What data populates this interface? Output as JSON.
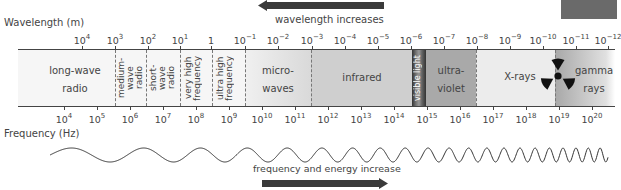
{
  "header": {
    "wavelength_label": "Wavelength (m)",
    "wavelength_arrow_text": "wavelength increases",
    "corner_badge": ""
  },
  "footer": {
    "frequency_label": "Frequency (Hz)",
    "frequency_arrow_text": "frequency and energy increase"
  },
  "wavelength_ticks": [
    {
      "base": "10",
      "exp": "4",
      "x": 82
    },
    {
      "base": "10",
      "exp": "3",
      "x": 115
    },
    {
      "base": "10",
      "exp": "2",
      "x": 148
    },
    {
      "base": "10",
      "exp": "1",
      "x": 180
    },
    {
      "base": "1",
      "exp": "",
      "x": 211
    },
    {
      "base": "10",
      "exp": "−1",
      "x": 245
    },
    {
      "base": "10",
      "exp": "−2",
      "x": 278
    },
    {
      "base": "10",
      "exp": "−3",
      "x": 312
    },
    {
      "base": "10",
      "exp": "−4",
      "x": 345
    },
    {
      "base": "10",
      "exp": "−5",
      "x": 378
    },
    {
      "base": "10",
      "exp": "−6",
      "x": 411
    },
    {
      "base": "10",
      "exp": "−7",
      "x": 444
    },
    {
      "base": "10",
      "exp": "−8",
      "x": 477
    },
    {
      "base": "10",
      "exp": "−9",
      "x": 510
    },
    {
      "base": "10",
      "exp": "−10",
      "x": 543
    },
    {
      "base": "10",
      "exp": "−11",
      "x": 576
    },
    {
      "base": "10",
      "exp": "−12",
      "x": 608
    }
  ],
  "frequency_ticks": [
    {
      "base": "10",
      "exp": "4",
      "x": 64
    },
    {
      "base": "10",
      "exp": "5",
      "x": 97
    },
    {
      "base": "10",
      "exp": "6",
      "x": 130
    },
    {
      "base": "10",
      "exp": "7",
      "x": 163
    },
    {
      "base": "10",
      "exp": "8",
      "x": 196
    },
    {
      "base": "10",
      "exp": "9",
      "x": 229
    },
    {
      "base": "10",
      "exp": "10",
      "x": 262
    },
    {
      "base": "10",
      "exp": "11",
      "x": 295
    },
    {
      "base": "10",
      "exp": "12",
      "x": 328
    },
    {
      "base": "10",
      "exp": "13",
      "x": 361
    },
    {
      "base": "10",
      "exp": "14",
      "x": 394
    },
    {
      "base": "10",
      "exp": "15",
      "x": 427
    },
    {
      "base": "10",
      "exp": "16",
      "x": 460
    },
    {
      "base": "10",
      "exp": "17",
      "x": 493
    },
    {
      "base": "10",
      "exp": "18",
      "x": 526
    },
    {
      "base": "10",
      "exp": "19",
      "x": 559
    },
    {
      "base": "10",
      "exp": "20",
      "x": 592
    }
  ],
  "regions": {
    "long_wave_radio": {
      "line1": "long-wave",
      "line2": "radio"
    },
    "medium_wave_radio": "medium-wave radio",
    "short_wave_radio": "short-wave radio",
    "very_high_frequency": "very high frequency",
    "ultra_high_frequency": "ultra high frequency",
    "microwaves": {
      "line1": "micro-",
      "line2": "waves"
    },
    "infrared": "infrared",
    "visible_light": "visible light",
    "ultraviolet": {
      "line1": "ultra-",
      "line2": "violet"
    },
    "x_rays": "X-rays",
    "gamma_rays": {
      "line1": "gamma",
      "line2": "rays"
    }
  },
  "icons": {
    "radiation": "radiation-trefoil-icon"
  },
  "colors": {
    "radio_bg": "#f6f6f6",
    "microwave_bg": "#e4e4e4",
    "infrared_bg": "#cfcfcf",
    "visible_bg": "#555555",
    "ultraviolet_bg": "#a9a9a9",
    "xray_bg": "#ececec",
    "gamma_bg": "#bdbdbd",
    "arrow": "#3a3a3a",
    "badge": "#6a6a6a"
  }
}
